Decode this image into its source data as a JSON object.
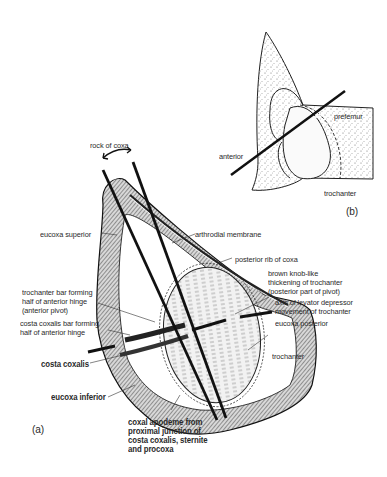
{
  "figure": {
    "panel_a": {
      "tag": "(a)",
      "labels": {
        "rock_of_coxa": "rock of coxa",
        "eucoxa_superior": "eucoxa superior",
        "arthrodial_membrane": "arthrodial membrane",
        "posterior_rib": "posterior rib of coxa",
        "brown_knob": [
          "brown knob-like",
          "thickening of trochanter",
          "(posterior part of pivot)"
        ],
        "axis_levator": [
          "axis of levator depressor",
          "movement of trochanter"
        ],
        "eucoxa_posterior": "eucoxa posterior",
        "trochanter_bar": [
          "trochanter bar forming",
          "half of anterior hinge",
          "(anterior pivot)"
        ],
        "costa_coxalis_bar": [
          "costa coxalis bar forming",
          "half of anterior  hinge"
        ],
        "costa_coxalis": "costa coxalis",
        "trochanter": "trochanter",
        "eucoxa_inferior": "eucoxa inferior",
        "coxal_apodeme": [
          "coxal apodeme from",
          "proximal junction of",
          "costa coxalis, sternite",
          "and procoxa"
        ]
      }
    },
    "panel_b": {
      "tag": "(b)",
      "labels": {
        "prefemur": "prefemur",
        "anterior": "anterior",
        "trochanter": "trochanter"
      }
    }
  }
}
